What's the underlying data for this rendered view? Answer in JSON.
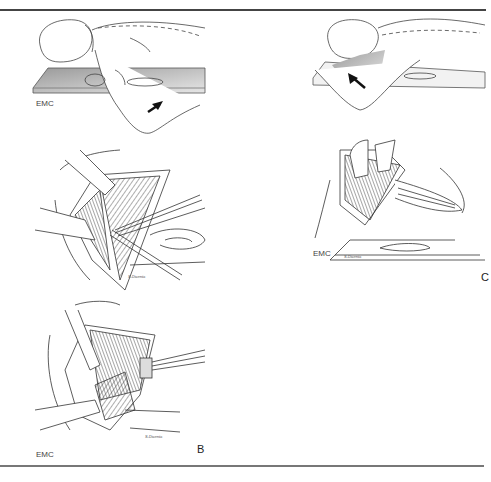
{
  "figure": {
    "panels": [
      {
        "id": "A-top",
        "label": "",
        "logo": "EMC",
        "content": "patient lying on side, head on pillow, arrow indicating arm direction"
      },
      {
        "id": "A-mid",
        "label": "",
        "signature": "S.Dicenta",
        "content": "surgical field with retractors and instrument"
      },
      {
        "id": "B",
        "label": "B",
        "logo": "EMC",
        "signature": "S.Dicenta",
        "content": "deep dissection with retractor holding structures"
      },
      {
        "id": "C-top",
        "label": "",
        "content": "patient lying on side, arm raised over head, arrow"
      },
      {
        "id": "C",
        "label": "C",
        "logo": "EMC",
        "signature": "S.Dicenta",
        "content": "surgical exposure with retracted tissue"
      }
    ],
    "labels": {
      "emc1": "EMC",
      "emc2": "EMC",
      "emc3": "EMC",
      "panel_b": "B",
      "panel_c": "C",
      "sig1": "S.Dicenta",
      "sig2": "S.Dicenta",
      "sig3": "S.Dicenta"
    }
  }
}
